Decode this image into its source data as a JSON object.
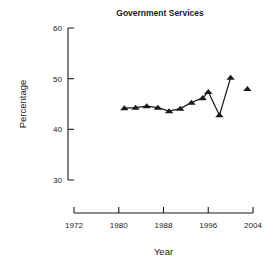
{
  "chart_data": {
    "type": "line",
    "title": "Government Services",
    "xlabel": "Year",
    "ylabel": "Percentage",
    "xlim": [
      1970,
      2006
    ],
    "ylim": [
      28,
      61
    ],
    "grid": false,
    "legend": false,
    "marker": "triangle-up",
    "color": "#1a1a1a",
    "xticks": [
      1972,
      1980,
      1988,
      1996,
      2004
    ],
    "xtick_labels": [
      "1972",
      "1980",
      "1988",
      "1996",
      "2004"
    ],
    "yticks": [
      30,
      40,
      50,
      60
    ],
    "ytick_labels": [
      "30",
      "40",
      "50",
      "60"
    ],
    "series": [
      {
        "name": "Government Services",
        "connected": true,
        "x": [
          1981,
          1983,
          1985,
          1987,
          1989,
          1991,
          1993,
          1995,
          1996,
          1998,
          2000
        ],
        "y": [
          44.2,
          44.3,
          44.6,
          44.3,
          43.6,
          44.1,
          45.3,
          46.2,
          47.4,
          42.8,
          50.2
        ]
      },
      {
        "name": "Government Services (isolated point)",
        "connected": false,
        "x": [
          2003
        ],
        "y": [
          48.0
        ]
      }
    ]
  },
  "axes": {
    "title_text": "Government Services",
    "x_axis_label": "Year",
    "y_axis_label": "Percentage"
  }
}
